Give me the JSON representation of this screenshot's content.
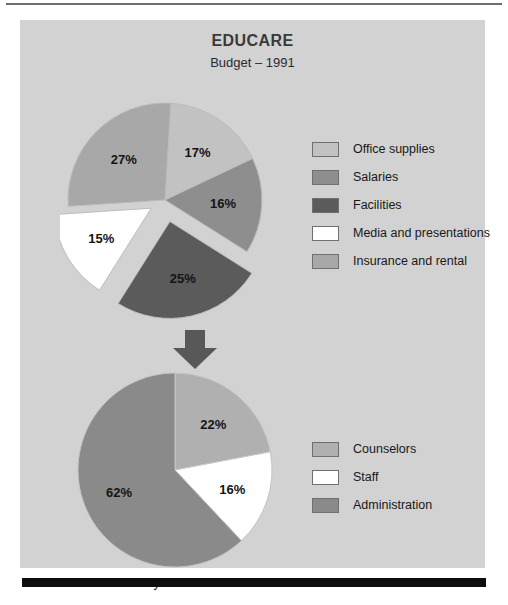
{
  "header": {
    "title": "EDUCARE",
    "subtitle": "Budget – 1991"
  },
  "caption": "Salary Distribution",
  "colors": {
    "panel_background": "#d2d2d2",
    "page_background": "#ffffff",
    "top_rule": "#6d6d6d",
    "bottom_bar": "#0d0d0d",
    "arrow": "#585858",
    "office_supplies": "#c2c2c2",
    "salaries": "#8e8e8e",
    "facilities": "#5b5b5b",
    "media_and_presentations": "#ffffff",
    "insurance_and_rental": "#a8a8a8",
    "counselors": "#b0b0b0",
    "staff": "#ffffff",
    "administration": "#8a8a8a"
  },
  "legends": {
    "top": [
      {
        "label": "Office supplies",
        "color": "#c2c2c2"
      },
      {
        "label": "Salaries",
        "color": "#8e8e8e"
      },
      {
        "label": "Facilities",
        "color": "#5b5b5b"
      },
      {
        "label": "Media and presentations",
        "color": "#ffffff"
      },
      {
        "label": "Insurance and rental",
        "color": "#a8a8a8"
      }
    ],
    "bottom": [
      {
        "label": "Counselors",
        "color": "#b0b0b0"
      },
      {
        "label": "Staff",
        "color": "#ffffff"
      },
      {
        "label": "Administration",
        "color": "#8a8a8a"
      }
    ]
  },
  "chart_data": [
    {
      "type": "pie",
      "title": "EDUCARE",
      "subtitle": "Budget – 1991",
      "unit": "percent",
      "legend_position": "right",
      "labels": [
        "Office supplies",
        "Salaries",
        "Facilities",
        "Media and presentations",
        "Insurance and rental"
      ],
      "values": [
        17,
        16,
        25,
        15,
        27
      ],
      "data_labels": [
        "17%",
        "16%",
        "25%",
        "15%",
        "27%"
      ],
      "colors": [
        "#c2c2c2",
        "#8e8e8e",
        "#5b5b5b",
        "#ffffff",
        "#a8a8a8"
      ],
      "exploded": [
        "Facilities",
        "Media and presentations"
      ]
    },
    {
      "type": "pie",
      "title": "Salary Distribution",
      "unit": "percent",
      "legend_position": "right",
      "labels": [
        "Counselors",
        "Staff",
        "Administration"
      ],
      "values": [
        22,
        16,
        62
      ],
      "data_labels": [
        "22%",
        "16%",
        "62%"
      ],
      "colors": [
        "#b0b0b0",
        "#ffffff",
        "#8a8a8a"
      ],
      "exploded": []
    }
  ]
}
